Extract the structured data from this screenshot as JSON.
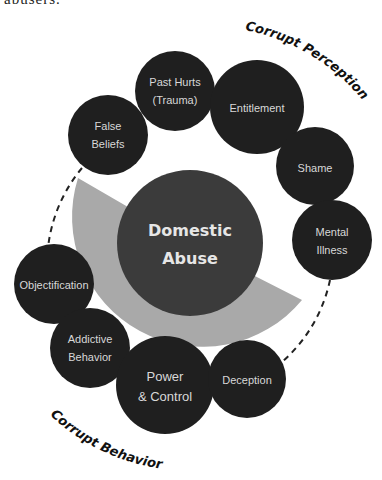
{
  "header": {
    "cut_text": "abusers."
  },
  "colors": {
    "background": "#ffffff",
    "outer_node": "#1f1f1f",
    "center_node": "#3b3b3b",
    "wedge": "#a9a9a9",
    "node_text": "#d8d8d8",
    "center_text": "#e6e6e6",
    "dashed_line": "#222222"
  },
  "center": {
    "line1": "Domestic",
    "line2": "Abuse"
  },
  "groups": {
    "perception": {
      "label": "Corrupt Perception"
    },
    "behavior": {
      "label": "Corrupt Behavior"
    }
  },
  "nodes": [
    {
      "id": "false-beliefs",
      "group": "perception",
      "lines": [
        "False",
        "Beliefs"
      ]
    },
    {
      "id": "past-hurts",
      "group": "perception",
      "lines": [
        "Past Hurts",
        "(Trauma)"
      ]
    },
    {
      "id": "entitlement",
      "group": "perception",
      "lines": [
        "Entitlement"
      ]
    },
    {
      "id": "shame",
      "group": "perception",
      "lines": [
        "Shame"
      ]
    },
    {
      "id": "mental-illness",
      "group": "perception",
      "lines": [
        "Mental",
        "Illness"
      ]
    },
    {
      "id": "objectification",
      "group": "behavior",
      "lines": [
        "Objectification"
      ]
    },
    {
      "id": "addictive-behavior",
      "group": "behavior",
      "lines": [
        "Addictive",
        "Behavior"
      ]
    },
    {
      "id": "power-control",
      "group": "behavior",
      "lines": [
        "Power",
        "& Control"
      ]
    },
    {
      "id": "deception",
      "group": "behavior",
      "lines": [
        "Deception"
      ]
    }
  ]
}
